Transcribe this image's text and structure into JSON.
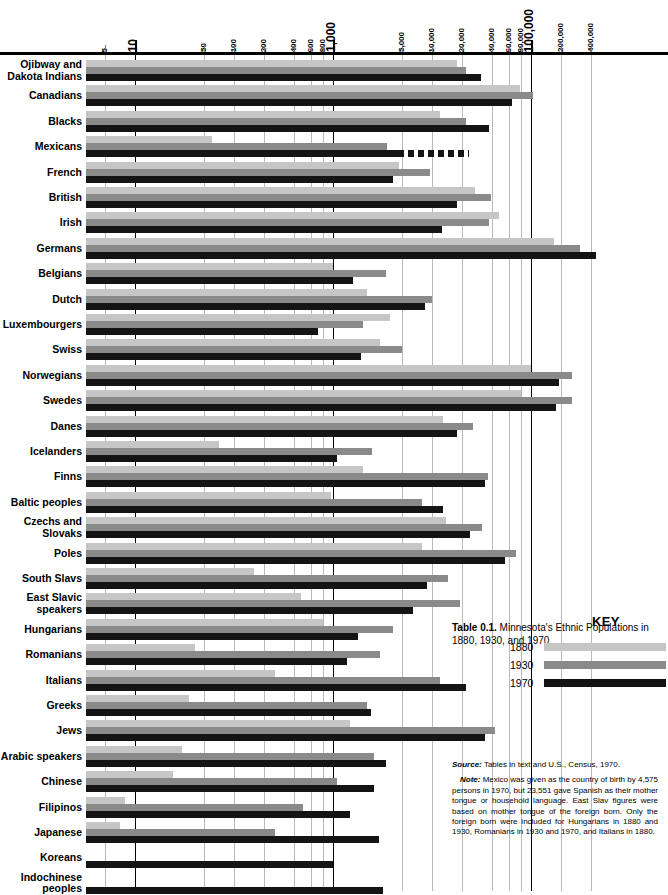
{
  "caption": {
    "label": "Table 0.1.",
    "text": " Minnesota's Ethnic Populations in 1880, 1930, and 1970"
  },
  "key": {
    "title": "KEY",
    "entries": [
      {
        "year": "1880",
        "color": "#c6c6c6"
      },
      {
        "year": "1930",
        "color": "#8a8a8a"
      },
      {
        "year": "1970",
        "color": "#141414"
      }
    ]
  },
  "notes": {
    "source_label": "Source:",
    "source_text": " Tables in text and U.S., Census, 1970.",
    "note_label": "Note:",
    "note_text": " Mexico was given as the country of birth by 4,575 persons in 1970, but 23,551 gave Spanish as their mother tongue or household language. East Slav figures were based on mother tongue of the foreign born. Only the foreign born were included for Hungarians in 1880 and 1930, Romanians in 1930 and 1970, and Italians in 1880."
  },
  "chart_data": {
    "type": "bar",
    "orientation": "horizontal",
    "title": "Minnesota's Ethnic Populations in 1880, 1930, and 1970",
    "xlabel": "",
    "ylabel": "",
    "xscale": "log",
    "xlim": [
      4,
      500000
    ],
    "grid": true,
    "legend_position": "bottom-right",
    "axis_ticks": [
      {
        "value": 5,
        "label": "5",
        "major": false
      },
      {
        "value": 10,
        "label": "10",
        "major": true
      },
      {
        "value": 50,
        "label": "50",
        "major": false
      },
      {
        "value": 100,
        "label": "100",
        "major": false
      },
      {
        "value": 200,
        "label": "200",
        "major": false
      },
      {
        "value": 400,
        "label": "400",
        "major": false
      },
      {
        "value": 600,
        "label": "600",
        "major": false
      },
      {
        "value": 800,
        "label": "800",
        "major": false
      },
      {
        "value": 1000,
        "label": "1,000",
        "major": true
      },
      {
        "value": 5000,
        "label": "5,000",
        "major": false
      },
      {
        "value": 10000,
        "label": "10,000",
        "major": false
      },
      {
        "value": 20000,
        "label": "20,000",
        "major": false
      },
      {
        "value": 40000,
        "label": "40,000",
        "major": false
      },
      {
        "value": 60000,
        "label": "60,000",
        "major": false
      },
      {
        "value": 80000,
        "label": "80,000",
        "major": false
      },
      {
        "value": 100000,
        "label": "100,000",
        "major": true
      },
      {
        "value": 200000,
        "label": "200,000",
        "major": false
      },
      {
        "value": 400000,
        "label": "400,000",
        "major": false
      }
    ],
    "series": [
      {
        "name": "1880",
        "color": "#c6c6c6"
      },
      {
        "name": "1930",
        "color": "#8a8a8a"
      },
      {
        "name": "1970",
        "color": "#141414"
      }
    ],
    "categories": [
      "Ojibway and Dakota Indians",
      "Canadians",
      "Blacks",
      "Mexicans",
      "French",
      "British",
      "Irish",
      "Germans",
      "Belgians",
      "Dutch",
      "Luxembourgers",
      "Swiss",
      "Norwegians",
      "Swedes",
      "Danes",
      "Icelanders",
      "Finns",
      "Baltic peoples",
      "Czechs and Slovaks",
      "Poles",
      "South Slavs",
      "East Slavic speakers",
      "Hungarians",
      "Romanians",
      "Italians",
      "Greeks",
      "Jews",
      "Arabic speakers",
      "Chinese",
      "Filipinos",
      "Japanese",
      "Koreans",
      "Indochinese peoples"
    ],
    "rows": [
      {
        "label_line1": "Ojibway and",
        "label_line2": "Dakota Indians",
        "v1880": 18000,
        "v1930": 22000,
        "v1970": 31000
      },
      {
        "label_line1": "Canadians",
        "label_line2": "",
        "v1880": 78000,
        "v1930": 105000,
        "v1970": 64000
      },
      {
        "label_line1": "Blacks",
        "label_line2": "",
        "v1880": 12000,
        "v1930": 22000,
        "v1970": 38000
      },
      {
        "label_line1": "Mexicans",
        "label_line2": "",
        "v1880": 60,
        "v1930": 3500,
        "v1970": 4575,
        "dashed1970": true,
        "dashed_to": 23551
      },
      {
        "label_line1": "French",
        "label_line2": "",
        "v1880": 4600,
        "v1930": 9500,
        "v1970": 4000
      },
      {
        "label_line1": "British",
        "label_line2": "",
        "v1880": 27000,
        "v1930": 39000,
        "v1970": 18000
      },
      {
        "label_line1": "Irish",
        "label_line2": "",
        "v1880": 48000,
        "v1930": 38000,
        "v1970": 12500
      },
      {
        "label_line1": "Germans",
        "label_line2": "",
        "v1880": 170000,
        "v1930": 310000,
        "v1970": 450000
      },
      {
        "label_line1": "Belgians",
        "label_line2": "",
        "v1880": 1000,
        "v1930": 3400,
        "v1970": 1600
      },
      {
        "label_line1": "Dutch",
        "label_line2": "",
        "v1880": 2200,
        "v1930": 10000,
        "v1970": 8500
      },
      {
        "label_line1": "Luxembourgers",
        "label_line2": "",
        "v1880": 3800,
        "v1930": 2000,
        "v1970": 700
      },
      {
        "label_line1": "Swiss",
        "label_line2": "",
        "v1880": 3000,
        "v1930": 5000,
        "v1970": 1900
      },
      {
        "label_line1": "Norwegians",
        "label_line2": "",
        "v1880": 100000,
        "v1930": 260000,
        "v1970": 190000
      },
      {
        "label_line1": "Swedes",
        "label_line2": "",
        "v1880": 80000,
        "v1930": 260000,
        "v1970": 180000
      },
      {
        "label_line1": "Danes",
        "label_line2": "",
        "v1880": 13000,
        "v1930": 26000,
        "v1970": 18000
      },
      {
        "label_line1": "Icelanders",
        "label_line2": "",
        "v1880": 70,
        "v1930": 2500,
        "v1970": 1100
      },
      {
        "label_line1": "Finns",
        "label_line2": "",
        "v1880": 2000,
        "v1930": 37000,
        "v1970": 34000
      },
      {
        "label_line1": "Baltic peoples",
        "label_line2": "",
        "v1880": 950,
        "v1930": 8000,
        "v1970": 13000
      },
      {
        "label_line1": "Czechs and",
        "label_line2": "Slovaks",
        "v1880": 14000,
        "v1930": 32000,
        "v1970": 24000
      },
      {
        "label_line1": "Poles",
        "label_line2": "",
        "v1880": 8000,
        "v1930": 70000,
        "v1970": 55000
      },
      {
        "label_line1": "South Slavs",
        "label_line2": "",
        "v1880": 160,
        "v1930": 14500,
        "v1970": 9000
      },
      {
        "label_line1": "East Slavic",
        "label_line2": "speakers",
        "v1880": 480,
        "v1930": 19000,
        "v1970": 6500
      },
      {
        "label_line1": "Hungarians",
        "label_line2": "",
        "v1880": 800,
        "v1930": 4000,
        "v1970": 1800
      },
      {
        "label_line1": "Romanians",
        "label_line2": "",
        "v1880": 40,
        "v1930": 3000,
        "v1970": 1400
      },
      {
        "label_line1": "Italians",
        "label_line2": "",
        "v1880": 260,
        "v1930": 12000,
        "v1970": 22000
      },
      {
        "label_line1": "Greeks",
        "label_line2": "",
        "v1880": 35,
        "v1930": 2200,
        "v1970": 2400
      },
      {
        "label_line1": "Jews",
        "label_line2": "",
        "v1880": 1500,
        "v1930": 43000,
        "v1970": 34000
      },
      {
        "label_line1": "Arabic speakers",
        "label_line2": "",
        "v1880": 30,
        "v1930": 2600,
        "v1970": 3400
      },
      {
        "label_line1": "Chinese",
        "label_line2": "",
        "v1880": 24,
        "v1930": 1100,
        "v1970": 2600
      },
      {
        "label_line1": "Filipinos",
        "label_line2": "",
        "v1880": 8,
        "v1930": 500,
        "v1970": 1500
      },
      {
        "label_line1": "Japanese",
        "label_line2": "",
        "v1880": 7,
        "v1930": 260,
        "v1970": 2900
      },
      {
        "label_line1": "Koreans",
        "label_line2": "",
        "v1880": 0,
        "v1930": 0,
        "v1970": 1000
      },
      {
        "label_line1": "Indochinese",
        "label_line2": "peoples",
        "v1880": 0,
        "v1930": 0,
        "v1970": 3200
      }
    ]
  }
}
